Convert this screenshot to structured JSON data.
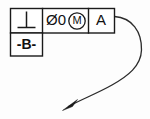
{
  "drawing": {
    "type": "gdt-feature-control-frame",
    "background_color": "#fdfdfd",
    "line_color": "#1a1a1a",
    "feature_control_frame": {
      "cells": [
        {
          "name": "geometric-characteristic",
          "symbol": "perpendicularity",
          "glyph": "⊥",
          "text": ""
        },
        {
          "name": "tolerance-zone",
          "text": "Ø0",
          "modifier": "M",
          "modifier_meaning": "maximum-material-condition"
        },
        {
          "name": "primary-datum-reference",
          "text": "A"
        }
      ]
    },
    "datum_feature_symbol": {
      "label": "-B-"
    },
    "leader": {
      "description": "curved leader line with filled arrowhead",
      "arrow_direction": "down-left"
    }
  }
}
